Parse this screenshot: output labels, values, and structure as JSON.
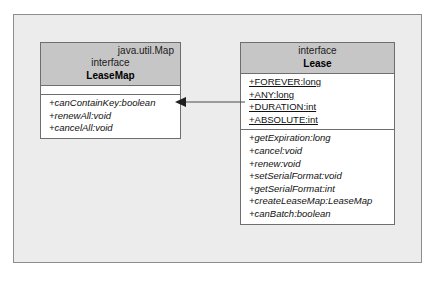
{
  "diagram": {
    "type": "uml-class-diagram",
    "title": "",
    "background_color": "#ececed",
    "frame_border_color": "#8d8d8d",
    "box_fill_color": "#ffffff",
    "box_header_fill_color": "#c6c6c6",
    "box_border_color": "#6e6e6e",
    "line_color": "#4a4a4a"
  },
  "classes": [
    {
      "id": "leasemap",
      "qualifier": "java.util.Map",
      "stereotype": "interface",
      "name": "LeaseMap",
      "attributes": [],
      "methods": [
        "+canContainKey:boolean",
        "+renewAll:void",
        "+cancelAll:void"
      ]
    },
    {
      "id": "lease",
      "qualifier": "",
      "stereotype": "interface",
      "name": "Lease",
      "attributes": [
        "+FOREVER:long",
        "+ANY:long",
        "+DURATION:int",
        "+ABSOLUTE:int"
      ],
      "methods": [
        "+getExpiration:long",
        "+cancel:void",
        "+renew:void",
        "+setSerialFormat:void",
        "+getSerialFormat:int",
        "+createLeaseMap:LeaseMap",
        "+canBatch:boolean"
      ]
    }
  ],
  "relationships": [
    {
      "id": "lease-uses-leasemap",
      "from": "lease",
      "to": "leasemap",
      "kind": "association",
      "arrowhead": "solid-filled-triangle",
      "line_style": "solid",
      "label": ""
    }
  ]
}
